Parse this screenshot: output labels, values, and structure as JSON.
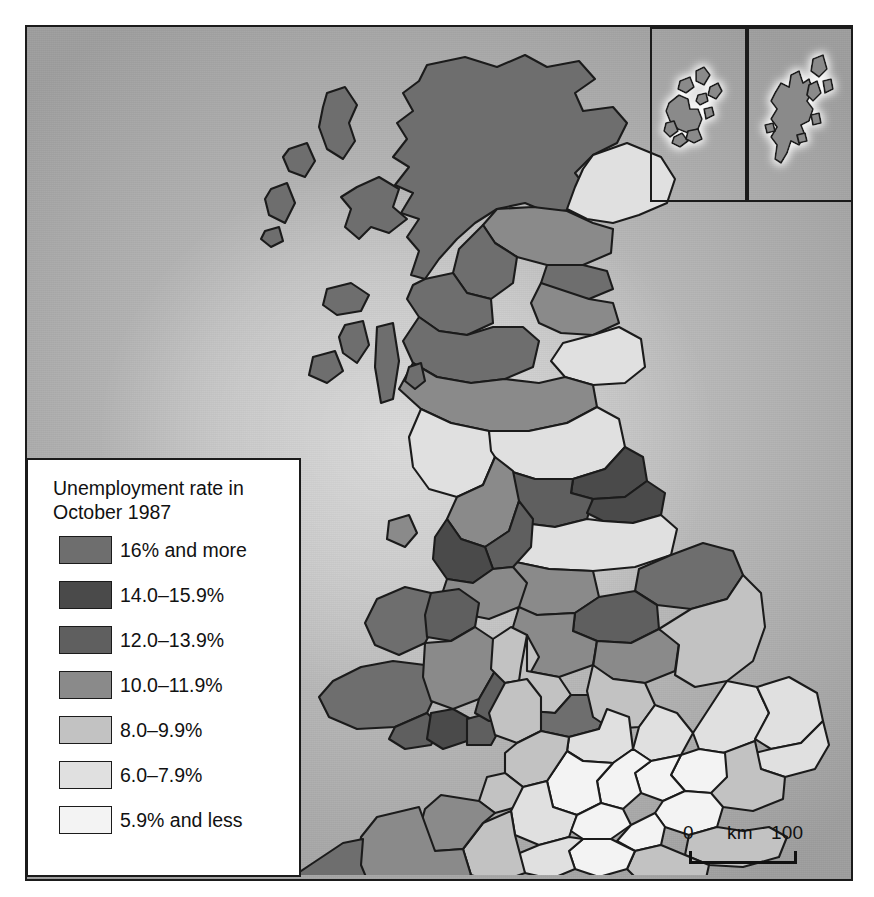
{
  "map": {
    "title": "Unemployment rate in United Kingdom counties, October 1987",
    "region": "United Kingdom",
    "background_color": "#b2b2b2",
    "border_color": "#1b1b1b"
  },
  "legend": {
    "title_line1": "Unemployment rate in",
    "title_line2": "October 1987",
    "items": [
      {
        "label": "16% and more",
        "color": "#6e6e6e",
        "min": 16.0,
        "max": null
      },
      {
        "label": "14.0–15.9%",
        "color": "#4a4a4a",
        "min": 14.0,
        "max": 15.9
      },
      {
        "label": "12.0–13.9%",
        "color": "#5f5f5f",
        "min": 12.0,
        "max": 13.9
      },
      {
        "label": "10.0–11.9%",
        "color": "#8a8a8a",
        "min": 10.0,
        "max": 11.9
      },
      {
        "label": "8.0–9.9%",
        "color": "#c2c2c2",
        "min": 8.0,
        "max": 9.9
      },
      {
        "label": "6.0–7.9%",
        "color": "#e0e0e0",
        "min": 6.0,
        "max": 7.9
      },
      {
        "label": "5.9% and less",
        "color": "#f3f3f3",
        "min": null,
        "max": 5.9
      }
    ]
  },
  "scalebar": {
    "zero": "0",
    "unit": "km",
    "max": "100"
  },
  "insets": [
    {
      "name": "orkney-islands",
      "label": ""
    },
    {
      "name": "shetland-islands",
      "label": ""
    }
  ],
  "chart_data": {
    "type": "map",
    "title": "Unemployment rate in October 1987",
    "units": "percent",
    "classes": [
      "16% and more",
      "14.0–15.9%",
      "12.0–13.9%",
      "10.0–11.9%",
      "8.0–9.9%",
      "6.0–7.9%",
      "5.9% and less"
    ],
    "class_colors": [
      "#6e6e6e",
      "#4a4a4a",
      "#5f5f5f",
      "#8a8a8a",
      "#c2c2c2",
      "#e0e0e0",
      "#f3f3f3"
    ]
  }
}
